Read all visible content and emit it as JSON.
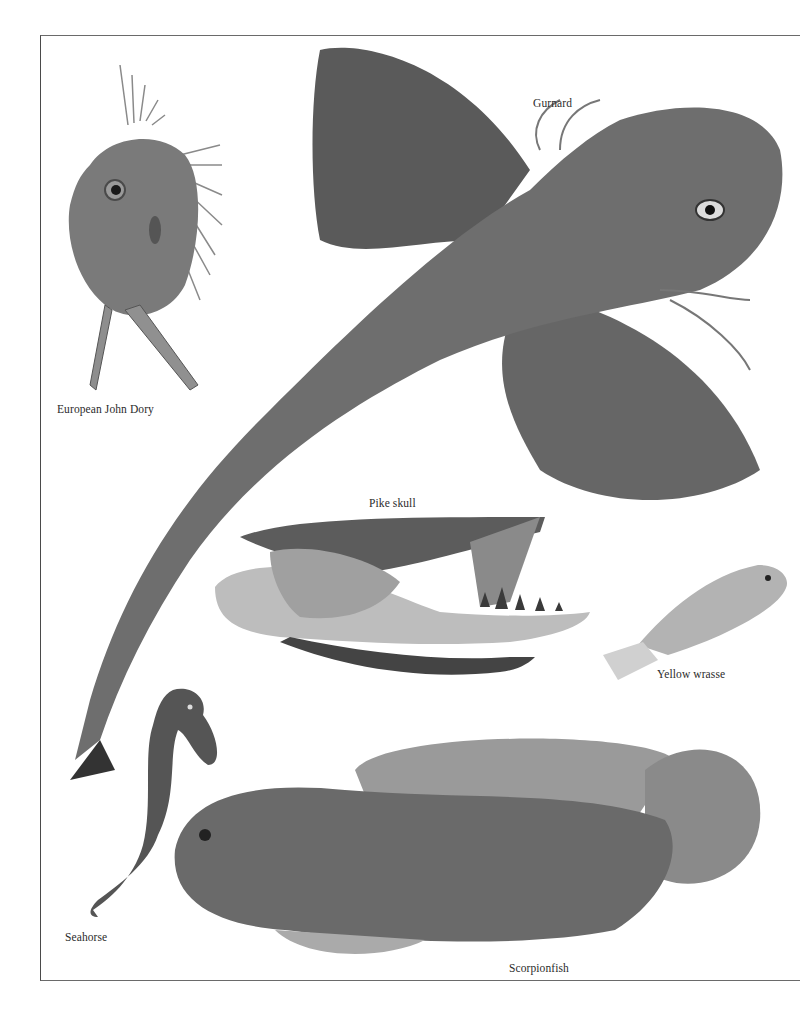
{
  "page": {
    "type": "natural-history plate",
    "background": "#ffffff",
    "frame_color": "#555555"
  },
  "specimens": [
    {
      "id": "john-dory",
      "label": "European John Dory",
      "tone": "#7a7a7a"
    },
    {
      "id": "gurnard",
      "label": "Gurnard",
      "tone": "#6e6e6e"
    },
    {
      "id": "pike-skull",
      "label": "Pike skull",
      "tone": "#a8a8a8"
    },
    {
      "id": "yellow-wrasse",
      "label": "Yellow wrasse",
      "tone": "#b3b3b3"
    },
    {
      "id": "seahorse",
      "label": "Seahorse",
      "tone": "#555555"
    },
    {
      "id": "scorpionfish",
      "label": "Scorpionfish",
      "tone": "#6a6a6a"
    }
  ]
}
